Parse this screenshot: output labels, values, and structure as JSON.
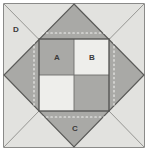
{
  "figure": {
    "canvas": {
      "width": 148,
      "height": 151
    },
    "colors": {
      "background": "#e8e8e6",
      "corner_triangle": "#e2e2df",
      "diamond": "#a9a9a6",
      "quadrant_dark": "#a9a9a6",
      "quadrant_light": "#eeeeeb",
      "outline": "#5a5a58",
      "thin_line": "#8d8d8a",
      "dotted_line": "#f2f2ef",
      "label_text": "#3a3a3a"
    },
    "outer_square": {
      "x": 4,
      "y": 4,
      "width": 140,
      "height": 143
    },
    "diamond_vertices": [
      {
        "name": "top",
        "x": 74,
        "y": 4
      },
      {
        "name": "right",
        "x": 144,
        "y": 75
      },
      {
        "name": "bottom",
        "x": 74,
        "y": 147
      },
      {
        "name": "left",
        "x": 4,
        "y": 75
      }
    ],
    "center_square": {
      "x": 39,
      "y": 39,
      "width": 70,
      "height": 72
    },
    "quadrants": [
      {
        "name": "top-left",
        "label": "A",
        "shade": "dark"
      },
      {
        "name": "top-right",
        "label": "B",
        "shade": "light"
      },
      {
        "name": "bottom-left",
        "label": "",
        "shade": "light"
      },
      {
        "name": "bottom-right",
        "label": "",
        "shade": "dark"
      }
    ],
    "labels": [
      {
        "id": "A",
        "text": "A",
        "x": 57,
        "y": 57,
        "region": "center-square-top-left-quadrant"
      },
      {
        "id": "B",
        "text": "B",
        "x": 92,
        "y": 57,
        "region": "center-square-top-right-quadrant"
      },
      {
        "id": "C",
        "text": "C",
        "x": 75,
        "y": 129,
        "region": "bottom-diamond-triangle"
      },
      {
        "id": "D",
        "text": "D",
        "x": 16,
        "y": 30,
        "region": "top-left-corner-triangle"
      }
    ],
    "corner_diagonals": [
      {
        "from": "top-left",
        "x1": 4,
        "y1": 4,
        "x2": 74,
        "y2": 75
      },
      {
        "from": "top-right",
        "x1": 144,
        "y1": 4,
        "x2": 74,
        "y2": 75
      },
      {
        "from": "bottom-left",
        "x1": 4,
        "y1": 147,
        "x2": 74,
        "y2": 75
      },
      {
        "from": "bottom-right",
        "x1": 144,
        "y1": 147,
        "x2": 74,
        "y2": 75
      }
    ],
    "dotted_guides": [
      {
        "name": "top",
        "x1": 42,
        "y1": 33,
        "x2": 107,
        "y2": 33
      },
      {
        "name": "right",
        "x1": 114,
        "y1": 42,
        "x2": 114,
        "y2": 108
      },
      {
        "name": "bottom",
        "x1": 42,
        "y1": 117,
        "x2": 107,
        "y2": 117
      },
      {
        "name": "left",
        "x1": 34,
        "y1": 42,
        "x2": 34,
        "y2": 108
      }
    ]
  }
}
